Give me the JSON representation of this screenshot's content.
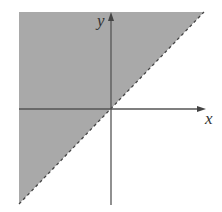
{
  "diagram": {
    "title": "",
    "axes": {
      "x_label": "x",
      "y_label": "y"
    },
    "region": {
      "inequality": "y > x",
      "boundary": "y = x",
      "boundary_style": "dashed",
      "fill_color": "#a9a9a9"
    },
    "colors": {
      "axis": "#555555",
      "boundary": "#444444",
      "shade": "#a9a9a9"
    }
  }
}
